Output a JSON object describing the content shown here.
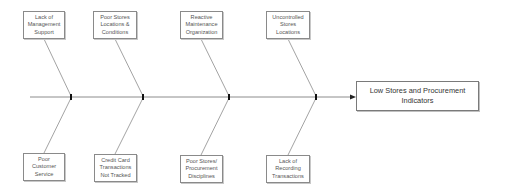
{
  "diagram": {
    "type": "fishbone",
    "effect": {
      "label": "Low Stores and Procurement Indicators"
    },
    "causes_top": [
      {
        "label": "Lack of Management Support"
      },
      {
        "label": "Poor Stores Locations & Conditions"
      },
      {
        "label": "Reactive Maintenance Organization"
      },
      {
        "label": "Uncontrolled Stores Locations"
      }
    ],
    "causes_bottom": [
      {
        "label": "Poor Customer Service"
      },
      {
        "label": "Credit Card Transactions Not Tracked"
      },
      {
        "label": "Poor Stores/ Procurement Disciplines"
      },
      {
        "label": "Lack of Recording Transactions"
      }
    ],
    "colors": {
      "line": "#8c8c8c",
      "border": "#8a8a8a",
      "text": "#555555",
      "joint": "#000000"
    }
  }
}
